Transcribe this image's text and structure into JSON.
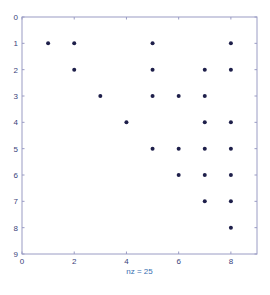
{
  "chart_data": {
    "type": "scatter",
    "subtype": "spy (sparsity pattern)",
    "title": "",
    "xlabel": "nz = 25",
    "ylabel": "",
    "xlim": [
      0,
      9
    ],
    "ylim": [
      9,
      0
    ],
    "y_axis_reversed": true,
    "grid": false,
    "legend": null,
    "x_ticks": [
      0,
      2,
      4,
      6,
      8
    ],
    "y_ticks": [
      0,
      1,
      2,
      3,
      4,
      5,
      6,
      7,
      8,
      9
    ],
    "nz": 25,
    "points": [
      {
        "row": 1,
        "col": 1
      },
      {
        "row": 1,
        "col": 2
      },
      {
        "row": 1,
        "col": 5
      },
      {
        "row": 1,
        "col": 8
      },
      {
        "row": 2,
        "col": 2
      },
      {
        "row": 2,
        "col": 5
      },
      {
        "row": 2,
        "col": 7
      },
      {
        "row": 2,
        "col": 8
      },
      {
        "row": 3,
        "col": 3
      },
      {
        "row": 3,
        "col": 5
      },
      {
        "row": 3,
        "col": 6
      },
      {
        "row": 3,
        "col": 7
      },
      {
        "row": 4,
        "col": 4
      },
      {
        "row": 4,
        "col": 7
      },
      {
        "row": 4,
        "col": 8
      },
      {
        "row": 5,
        "col": 5
      },
      {
        "row": 5,
        "col": 6
      },
      {
        "row": 5,
        "col": 7
      },
      {
        "row": 5,
        "col": 8
      },
      {
        "row": 6,
        "col": 6
      },
      {
        "row": 6,
        "col": 7
      },
      {
        "row": 6,
        "col": 8
      },
      {
        "row": 7,
        "col": 7
      },
      {
        "row": 7,
        "col": 8
      },
      {
        "row": 8,
        "col": 8
      }
    ]
  },
  "colors": {
    "axis": "#9a9cc4",
    "tick_label": "#3a3f7a",
    "marker": "#1e1f4a",
    "xlabel": "#3a6fb0",
    "background": "#ffffff"
  }
}
